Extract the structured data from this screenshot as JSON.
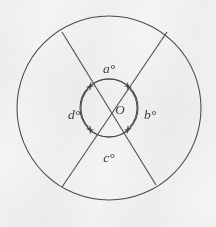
{
  "figure": {
    "background_color": "#f4f4f3",
    "stroke_color": "#4a4a4a",
    "label_color": "#3b3b3b",
    "center_label": "O",
    "angle_labels": {
      "top": "a°",
      "right": "b°",
      "bottom": "c°",
      "left": "d°"
    },
    "geometry": {
      "center_x": 109,
      "center_y": 108,
      "outer_radius": 92,
      "inner_radius": 29,
      "chord_1_endpoints": [
        [
          62,
          32
        ],
        [
          156,
          185
        ]
      ],
      "chord_2_endpoints": [
        [
          167,
          32
        ],
        [
          62,
          187
        ]
      ],
      "arc_markers": 4,
      "arrowheads_per_arc": 2
    },
    "label_positions": {
      "top": [
        109,
        70
      ],
      "right": [
        152,
        115
      ],
      "bottom": [
        109,
        158
      ],
      "left": [
        74,
        115
      ],
      "center": [
        122,
        114
      ]
    }
  }
}
